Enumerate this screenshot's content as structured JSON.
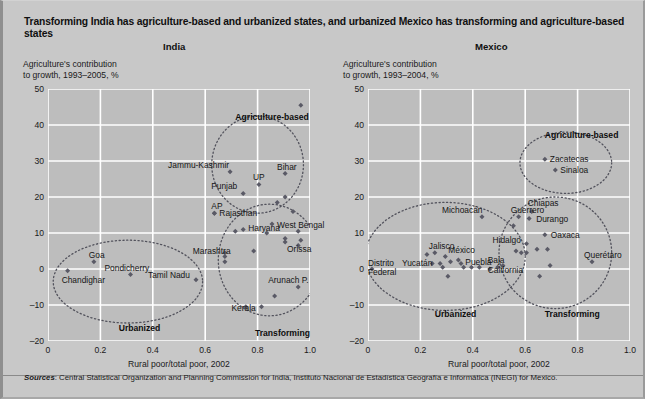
{
  "figure": {
    "title": "Transforming India has agriculture-based and urbanized states, and urbanized Mexico has transforming and agriculture-based states",
    "sources_word": "Sources",
    "sources_text": ": Central Statistical Organization and Planning Commission for India, Instituto Nacional de Estadística Geografía e Informática (INEGI) for Mexico.",
    "colors": {
      "page_background": "#c8c8c8",
      "plot_background": "#bdbdbd",
      "gridline": "#ffffff",
      "marker": "#5a5a66",
      "ellipse": "#52525c",
      "text": "#151515"
    }
  },
  "chart_data": [
    {
      "type": "scatter",
      "title": "India",
      "xlabel": "Rural poor/total poor, 2002",
      "ylabel": "Agriculture's contribution\nto growth, 1993–2005, %",
      "xlim": [
        0,
        1.0
      ],
      "ylim": [
        -20,
        50
      ],
      "xticks": [
        "0",
        "0.2",
        "0.4",
        "0.6",
        "0.8",
        "1.0"
      ],
      "yticks": [
        "50",
        "40",
        "30",
        "20",
        "10",
        "0",
        "-10",
        "-20"
      ],
      "grid": true,
      "points": [
        {
          "label": "Jammu-Kashmir",
          "x": 0.695,
          "y": 27.0,
          "label_dx": -62,
          "label_dy": -11
        },
        {
          "label": "Bihar",
          "x": 0.905,
          "y": 26.5,
          "label_dx": -8,
          "label_dy": -11
        },
        {
          "label": "Punjab",
          "x": 0.745,
          "y": 21.0,
          "label_dx": -32,
          "label_dy": -11
        },
        {
          "label": "UP",
          "x": 0.805,
          "y": 23.5,
          "label_dx": -6,
          "label_dy": -11
        },
        {
          "label": "",
          "x": 0.965,
          "y": 45.5,
          "label_dx": 0,
          "label_dy": 0
        },
        {
          "label": "AP",
          "x": 0.635,
          "y": 15.5,
          "label_dx": -3,
          "label_dy": -11
        },
        {
          "label": "Rajasthan",
          "x": 0.635,
          "y": 15.5,
          "label_dx": 5,
          "label_dy": -4
        },
        {
          "label": "Haryana",
          "x": 0.745,
          "y": 11.0,
          "label_dx": 5,
          "label_dy": -5
        },
        {
          "label": "West Bengal",
          "x": 0.855,
          "y": 12.5,
          "label_dx": 5,
          "label_dy": -3
        },
        {
          "label": "Marashtra",
          "x": 0.675,
          "y": 3.5,
          "label_dx": -32,
          "label_dy": -9
        },
        {
          "label": "Orissa",
          "x": 0.905,
          "y": 7.5,
          "label_dx": 2,
          "label_dy": 3
        },
        {
          "label": "Arunach P.",
          "x": 0.955,
          "y": -5.0,
          "label_dx": -30,
          "label_dy": -11
        },
        {
          "label": "Kerala",
          "x": 0.815,
          "y": -10.5,
          "label_dx": -30,
          "label_dy": -3
        },
        {
          "label": "Goa",
          "x": 0.175,
          "y": 2.0,
          "label_dx": -5,
          "label_dy": -11
        },
        {
          "label": "Pondicherry",
          "x": 0.315,
          "y": -1.5,
          "label_dx": -26,
          "label_dy": -10
        },
        {
          "label": "Tamil Nadu",
          "x": 0.565,
          "y": -3.0,
          "label_dx": -48,
          "label_dy": -9
        },
        {
          "label": "Chandighar",
          "x": 0.075,
          "y": -0.5,
          "label_dx": -6,
          "label_dy": 5
        }
      ],
      "extra_points": [
        {
          "x": 0.905,
          "y": 20.0
        },
        {
          "x": 0.875,
          "y": 18.5
        },
        {
          "x": 0.935,
          "y": 16.0
        },
        {
          "x": 0.955,
          "y": 10.5
        },
        {
          "x": 0.965,
          "y": 8.0
        },
        {
          "x": 0.955,
          "y": 6.5
        },
        {
          "x": 0.905,
          "y": 8.5
        },
        {
          "x": 0.835,
          "y": 10.0
        },
        {
          "x": 0.715,
          "y": 10.5
        },
        {
          "x": 0.675,
          "y": 2.0
        },
        {
          "x": 0.675,
          "y": 4.5
        },
        {
          "x": 0.785,
          "y": 5.0
        },
        {
          "x": 0.865,
          "y": -7.5
        },
        {
          "x": 0.755,
          "y": -10.5
        }
      ],
      "clusters": [
        {
          "label": "Agriculture-based",
          "cx": 0.8,
          "cy": 29.0,
          "rx": 0.175,
          "ry": 13.5,
          "label_x": 0.715,
          "label_y": 43.5
        },
        {
          "label": "Urbanized",
          "cx": 0.305,
          "cy": -3.5,
          "rx": 0.285,
          "ry": 11.5,
          "label_x": 0.27,
          "label_y": -15.0
        },
        {
          "label": "Transforming",
          "cx": 0.845,
          "cy": 2.5,
          "rx": 0.195,
          "ry": 15.5,
          "label_x": 0.79,
          "label_y": -16.5
        }
      ]
    },
    {
      "type": "scatter",
      "title": "Mexico",
      "xlabel": "Rural poor/total poor, 2002",
      "ylabel": "Agriculture's contribution\nto growth, 1993–2004, %",
      "xlim": [
        0,
        1.0
      ],
      "ylim": [
        -20,
        50
      ],
      "xticks": [
        "0",
        "0.2",
        "0.4",
        "0.6",
        "0.8",
        "1.0"
      ],
      "yticks": [
        "50",
        "40",
        "30",
        "20",
        "10",
        "0",
        "-10",
        "-20"
      ],
      "grid": true,
      "points": [
        {
          "label": "Zacatecas",
          "x": 0.675,
          "y": 30.5,
          "label_dx": 5,
          "label_dy": -4
        },
        {
          "label": "Sinaloa",
          "x": 0.715,
          "y": 27.5,
          "label_dx": 5,
          "label_dy": -4
        },
        {
          "label": "Michoacán",
          "x": 0.435,
          "y": 14.5,
          "label_dx": -40,
          "label_dy": -11
        },
        {
          "label": "Guerrero",
          "x": 0.575,
          "y": 14.5,
          "label_dx": -8,
          "label_dy": -11
        },
        {
          "label": "Chiapas",
          "x": 0.625,
          "y": 16.0,
          "label_dx": -4,
          "label_dy": -12
        },
        {
          "label": "Durango",
          "x": 0.615,
          "y": 14.0,
          "label_dx": 7,
          "label_dy": -4
        },
        {
          "label": "Oaxaca",
          "x": 0.675,
          "y": 9.5,
          "label_dx": 6,
          "label_dy": -4
        },
        {
          "label": "Hidalgo",
          "x": 0.605,
          "y": 7.0,
          "label_dx": -34,
          "label_dy": -8
        },
        {
          "label": "Querétaro",
          "x": 0.855,
          "y": 2.0,
          "label_dx": -8,
          "label_dy": -11
        },
        {
          "label": "Jalisco",
          "x": 0.255,
          "y": 4.5,
          "label_dx": -6,
          "label_dy": -11
        },
        {
          "label": "México",
          "x": 0.295,
          "y": 3.5,
          "label_dx": 3,
          "label_dy": -10
        },
        {
          "label": "Yucatán",
          "x": 0.275,
          "y": 1.5,
          "label_dx": -38,
          "label_dy": -5
        },
        {
          "label": "Puebla",
          "x": 0.425,
          "y": 0.5,
          "label_dx": -14,
          "label_dy": -9
        },
        {
          "label": "Baja California",
          "x": 0.495,
          "y": 0.5,
          "label_dx": -10,
          "label_dy": -11
        },
        {
          "label": "Distrito Federal",
          "x": 0.015,
          "y": 0.0,
          "label_dx": -4,
          "label_dy": -10
        }
      ],
      "extra_points": [
        {
          "x": 0.225,
          "y": 4.0
        },
        {
          "x": 0.245,
          "y": 1.5
        },
        {
          "x": 0.315,
          "y": 2.0
        },
        {
          "x": 0.345,
          "y": 2.5
        },
        {
          "x": 0.355,
          "y": 1.5
        },
        {
          "x": 0.285,
          "y": 0.5
        },
        {
          "x": 0.365,
          "y": 0.5
        },
        {
          "x": 0.395,
          "y": 0.5
        },
        {
          "x": 0.305,
          "y": -2.0
        },
        {
          "x": 0.465,
          "y": 0.0
        },
        {
          "x": 0.515,
          "y": 1.0
        },
        {
          "x": 0.555,
          "y": 12.0
        },
        {
          "x": 0.585,
          "y": 4.5
        },
        {
          "x": 0.605,
          "y": 4.5
        },
        {
          "x": 0.645,
          "y": 5.5
        },
        {
          "x": 0.685,
          "y": 5.5
        },
        {
          "x": 0.695,
          "y": 1.0
        },
        {
          "x": 0.655,
          "y": -2.0
        },
        {
          "x": 0.565,
          "y": 5.0
        }
      ],
      "clusters": [
        {
          "label": "Agriculture-based",
          "cx": 0.755,
          "cy": 29.5,
          "rx": 0.175,
          "ry": 8.5,
          "label_x": 0.675,
          "label_y": 38.5
        },
        {
          "label": "Urbanized",
          "cx": 0.295,
          "cy": 3.5,
          "rx": 0.305,
          "ry": 15.0,
          "label_x": 0.255,
          "label_y": -11.0
        },
        {
          "label": "Transforming",
          "cx": 0.715,
          "cy": 4.5,
          "rx": 0.215,
          "ry": 15.5,
          "label_x": 0.675,
          "label_y": -11.0
        }
      ]
    }
  ]
}
